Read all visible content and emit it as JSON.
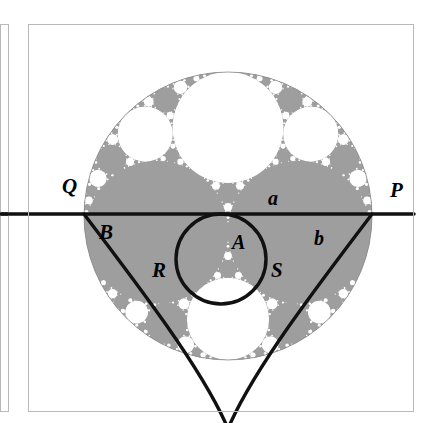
{
  "figure": {
    "kind": "apollonian-gasket-diagram",
    "title": "",
    "background_color": "#ffffff",
    "packing_fill_color": "#9e9e9e",
    "packing_gap_color": "#ffffff",
    "stroke_color": "#111111",
    "frame": {
      "border_color": "#b9b9b9",
      "x": 28,
      "y": 24,
      "width": 385,
      "height": 387
    },
    "left_strip": {
      "border_color": "#b9b9b9",
      "x": 0,
      "y": 24,
      "width": 8,
      "height": 387,
      "tick_y": 214
    },
    "outer_circle": {
      "cx": 228,
      "cy": 216,
      "r": 144
    },
    "line_pq": {
      "y": 214,
      "x1": 0,
      "x2": 414,
      "label_left": "Q",
      "label_right": "P"
    },
    "circle_a_inner": {
      "cx": 221,
      "cy": 259,
      "r": 45
    },
    "labels": [
      {
        "id": "Q",
        "text": "Q",
        "x": 62,
        "y": 176,
        "size": 21
      },
      {
        "id": "P",
        "text": "P",
        "x": 390,
        "y": 180,
        "size": 21
      },
      {
        "id": "a",
        "text": "a",
        "x": 268,
        "y": 188,
        "size": 20
      },
      {
        "id": "b",
        "text": "b",
        "x": 314,
        "y": 228,
        "size": 20
      },
      {
        "id": "A",
        "text": "A",
        "x": 232,
        "y": 232,
        "size": 20
      },
      {
        "id": "B",
        "text": "B",
        "x": 99,
        "y": 222,
        "size": 21
      },
      {
        "id": "R",
        "text": "R",
        "x": 152,
        "y": 260,
        "size": 21
      },
      {
        "id": "S",
        "text": "S",
        "x": 271,
        "y": 260,
        "size": 21
      }
    ]
  },
  "chart_data": {
    "type": "scatter",
    "xlabel": "",
    "ylabel": "",
    "grid": false,
    "legend": null,
    "annotations": [
      "Q",
      "P",
      "a",
      "b",
      "A",
      "B",
      "R",
      "S"
    ],
    "circles": [
      {
        "name": "outer",
        "cx": 228,
        "cy": 216,
        "r": 144,
        "fill": "#9e9e9e"
      },
      {
        "name": "top-gap",
        "cx": 228,
        "cy": 111,
        "r": 55,
        "fill": "#ffffff"
      },
      {
        "name": "left-large",
        "cx": 160,
        "cy": 228,
        "r": 72,
        "fill": "#9e9e9e"
      },
      {
        "name": "right-large",
        "cx": 296,
        "cy": 228,
        "r": 72,
        "fill": "#9e9e9e"
      },
      {
        "name": "bottom-gap",
        "cx": 228,
        "cy": 321,
        "r": 39,
        "fill": "#ffffff"
      },
      {
        "name": "circle-A",
        "cx": 221,
        "cy": 259,
        "r": 45,
        "fill": "none"
      }
    ]
  }
}
